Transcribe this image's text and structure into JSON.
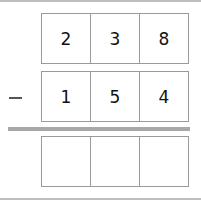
{
  "problem": {
    "operation": "subtraction",
    "operator_symbol": "minus",
    "minuend_digits": [
      "2",
      "3",
      "8"
    ],
    "subtrahend_digits": [
      "1",
      "5",
      "4"
    ],
    "answer_digits": [
      "",
      "",
      ""
    ]
  }
}
